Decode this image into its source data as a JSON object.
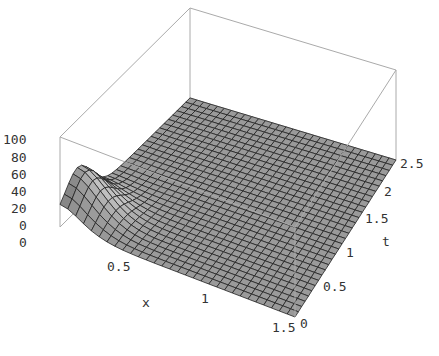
{
  "chart_data": {
    "type": "surface3d",
    "title": "",
    "xlabel": "x",
    "ylabel": "t",
    "zlabel": "",
    "xlim": [
      0,
      1.5
    ],
    "ylim": [
      0,
      2.5
    ],
    "zlim": [
      0,
      100
    ],
    "x_ticks": [
      "0",
      "0.5",
      "1",
      "1.5"
    ],
    "t_ticks": [
      "0",
      "0.5",
      "1",
      "1.5",
      "2",
      "2.5"
    ],
    "z_ticks": [
      "0",
      "20",
      "40",
      "60",
      "80",
      "100"
    ],
    "grid_lines_per_axis": 30,
    "surface_color": "#9a9a9a",
    "mesh_color": "#222222",
    "box_color": "#999999"
  },
  "labels": {
    "z": [
      "100",
      "80",
      "60",
      "40",
      "20",
      "0"
    ],
    "z_base": "0",
    "x": [
      "0.5",
      "1",
      "1.5"
    ],
    "x_name": "x",
    "t": [
      "0",
      "0.5",
      "1",
      "1.5",
      "2",
      "2.5"
    ],
    "t_name": "t"
  }
}
